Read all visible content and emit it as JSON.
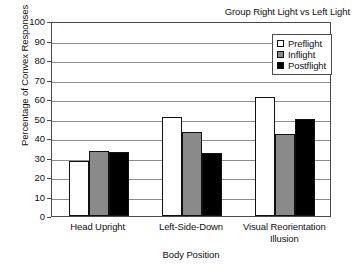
{
  "chart_data": {
    "type": "bar",
    "title": "Group Right Light vs Left Light",
    "xlabel": "Body Position",
    "ylabel": "Percentage of Convex Responses",
    "ylim": [
      0,
      100
    ],
    "ytick_step": 10,
    "yticks": [
      100,
      90,
      80,
      70,
      60,
      50,
      40,
      30,
      20,
      10,
      0
    ],
    "grid": true,
    "legend_position": "top-right",
    "categories": [
      "Head Upright",
      "Left-Side-Down",
      "Visual Reorientation Illusion"
    ],
    "category_lines": [
      [
        "Head Upright"
      ],
      [
        "Left-Side-Down"
      ],
      [
        "Visual Reorientation",
        "Illusion"
      ]
    ],
    "series": [
      {
        "name": "Preflight",
        "color": "#ffffff",
        "values": [
          28,
          51,
          61
        ]
      },
      {
        "name": "Inflight",
        "color": "#8a8a8a",
        "values": [
          33.5,
          43,
          42
        ]
      },
      {
        "name": "Postflight",
        "color": "#000000",
        "values": [
          33,
          32.5,
          49.5
        ]
      }
    ]
  },
  "legend": {
    "items": [
      {
        "label": "Preflight",
        "color": "#ffffff"
      },
      {
        "label": "Inflight",
        "color": "#8a8a8a"
      },
      {
        "label": "Postflight",
        "color": "#000000"
      }
    ]
  }
}
